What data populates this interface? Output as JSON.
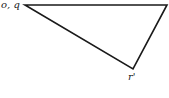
{
  "diagram": {
    "type": "vector triangle",
    "stroke_color": "#1a1a1a",
    "vertices": [
      {
        "id": "oq",
        "x": 25,
        "y": 5
      },
      {
        "id": "right",
        "x": 167,
        "y": 5
      },
      {
        "id": "r",
        "x": 133,
        "y": 69
      }
    ],
    "labels": {
      "oq": "o, q",
      "r": "r'"
    }
  }
}
